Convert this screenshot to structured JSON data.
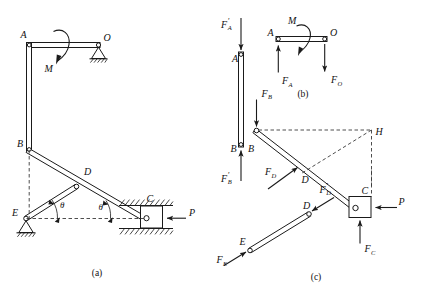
{
  "figure": {
    "background_color": "#ffffff",
    "line_color": "#1a1a1a",
    "dash_color": "#3a3a3a"
  },
  "captions": {
    "a": "(a)",
    "b": "(b)",
    "c": "(c)"
  },
  "panel_a": {
    "name": "assembled mechanism",
    "joints": {
      "A": "A",
      "O": "O",
      "B": "B",
      "D": "D",
      "C": "C",
      "E": "E"
    },
    "loads": {
      "moment": "M",
      "force_P": "P"
    },
    "angles": {
      "theta_left": "θ",
      "theta_right": "θ"
    },
    "supports": {
      "O": "pin-support-hatched",
      "E": "pin-support-hatched",
      "C": "slider-in-guide-hatched"
    }
  },
  "panel_b": {
    "name": "member AO free body",
    "joints": {
      "A": "A",
      "O": "O"
    },
    "loads": {
      "moment": "M",
      "force_A": "F",
      "force_A_sub": "A",
      "force_O": "F",
      "force_O_sub": "O"
    }
  },
  "panel_c": {
    "name": "exploded free bodies AB, BC, ED",
    "member_ab": {
      "top_label": "A",
      "bottom_label": "B",
      "force_top": "F",
      "force_top_sub": "A",
      "force_top_prime": "′",
      "force_bottom": "F",
      "force_bottom_sub": "B",
      "force_bottom_prime": "′"
    },
    "member_bc": {
      "label_B": "B",
      "label_D": "D",
      "label_C": "C",
      "label_H": "H",
      "force_B": "F",
      "force_B_sub": "B",
      "force_D": "F",
      "force_D_sub": "D",
      "force_C": "F",
      "force_C_sub": "C",
      "force_P": "P"
    },
    "member_ed": {
      "label_E": "E",
      "label_D": "D",
      "force_E": "F",
      "force_E_sub": "E",
      "force_D_prime": "F",
      "force_D_prime_sub": "D",
      "force_D_prime_mark": "′"
    }
  }
}
